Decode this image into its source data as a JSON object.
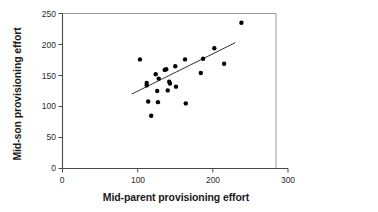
{
  "chart_data": {
    "type": "scatter",
    "title": "",
    "xlabel": "Mid-parent provisioning effort",
    "ylabel": "Mid-son provisioning effort",
    "xlim": [
      0,
      300
    ],
    "ylim": [
      0,
      250
    ],
    "xticks": [
      0,
      100,
      200,
      300
    ],
    "yticks": [
      0,
      50,
      100,
      150,
      200,
      250
    ],
    "xtick_labels": [
      "0",
      "100",
      "200",
      "300"
    ],
    "ytick_labels": [
      "0",
      "50",
      "100",
      "150",
      "200",
      "250"
    ],
    "grid": false,
    "legend": null,
    "marker": "filled-circle",
    "marker_color": "#000000",
    "points": [
      {
        "x": 103,
        "y": 176
      },
      {
        "x": 112,
        "y": 138
      },
      {
        "x": 112,
        "y": 134
      },
      {
        "x": 114,
        "y": 108
      },
      {
        "x": 118,
        "y": 85
      },
      {
        "x": 124,
        "y": 152
      },
      {
        "x": 126,
        "y": 125
      },
      {
        "x": 127,
        "y": 107
      },
      {
        "x": 128,
        "y": 145
      },
      {
        "x": 136,
        "y": 159
      },
      {
        "x": 138,
        "y": 160
      },
      {
        "x": 140,
        "y": 126
      },
      {
        "x": 142,
        "y": 140
      },
      {
        "x": 143,
        "y": 137
      },
      {
        "x": 150,
        "y": 165
      },
      {
        "x": 151,
        "y": 132
      },
      {
        "x": 163,
        "y": 176
      },
      {
        "x": 164,
        "y": 105
      },
      {
        "x": 184,
        "y": 154
      },
      {
        "x": 187,
        "y": 177
      },
      {
        "x": 202,
        "y": 194
      },
      {
        "x": 215,
        "y": 169
      },
      {
        "x": 238,
        "y": 235
      }
    ],
    "trendline": {
      "type": "linear-fit",
      "x_start": 92,
      "y_start": 120,
      "x_end": 230,
      "y_end": 203
    }
  },
  "axes": {
    "frame_color": "#808080",
    "axis_color": "#555555",
    "tick_color": "#555555"
  }
}
